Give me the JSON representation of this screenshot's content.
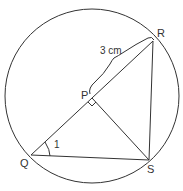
{
  "diagram": {
    "type": "circle-geometry",
    "circle": {
      "cx": 92,
      "cy": 96,
      "r": 87
    },
    "points": {
      "R": {
        "label": "R",
        "x": 153,
        "y": 41
      },
      "Q": {
        "label": "Q",
        "x": 31,
        "y": 155
      },
      "S": {
        "label": "S",
        "x": 149,
        "y": 160
      },
      "P": {
        "label": "P",
        "x": 92,
        "y": 98
      }
    },
    "segments": [
      "QR",
      "QS",
      "RS",
      "PS"
    ],
    "measurement": {
      "label": "3 cm",
      "segment": "PR"
    },
    "angle": {
      "label": "1",
      "vertex": "Q"
    },
    "right_angle": {
      "vertex": "P"
    },
    "colors": {
      "stroke": "#333333",
      "background": "#ffffff"
    }
  }
}
